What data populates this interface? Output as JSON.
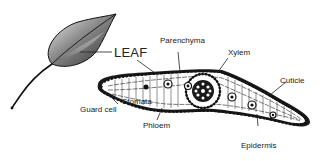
{
  "diagram": {
    "type": "labeled-illustration",
    "labels": {
      "leaf": "LEAF",
      "parenchyma": "Parenchyma",
      "xylem": "Xylem",
      "cuticle": "Cuticle",
      "guard_cell": "Guard cell",
      "stomata": "Stomata",
      "phloem": "Phloem",
      "epidermis": "Epidermis"
    },
    "colors": {
      "ink": "#1a1a1a",
      "background": "#ffffff",
      "cell_fill": "#ffffff"
    }
  }
}
